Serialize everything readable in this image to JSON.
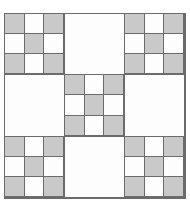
{
  "figure": {
    "canvas_width": 190,
    "canvas_height": 206,
    "background_color": "#ffffff"
  },
  "style": {
    "shaded_color": "#c9c9c9",
    "blank_color": "#fdfdfd",
    "line_color": "#6b6b6b",
    "outer_border_color": "#6b6b6b",
    "line_width": 1
  },
  "grid": {
    "rows": 3,
    "columns": 3,
    "cell_kind_legend": {
      "pieced": "3x3 checkerboard block",
      "plain": "solid blank block"
    },
    "cells": [
      {
        "index": 0,
        "row": 0,
        "column": 0,
        "position": "top-left",
        "kind": "pieced"
      },
      {
        "index": 1,
        "row": 0,
        "column": 1,
        "position": "top-center",
        "kind": "plain"
      },
      {
        "index": 2,
        "row": 0,
        "column": 2,
        "position": "top-right",
        "kind": "pieced"
      },
      {
        "index": 3,
        "row": 1,
        "column": 0,
        "position": "middle-left",
        "kind": "plain"
      },
      {
        "index": 4,
        "row": 1,
        "column": 1,
        "position": "center",
        "kind": "pieced"
      },
      {
        "index": 5,
        "row": 1,
        "column": 2,
        "position": "middle-right",
        "kind": "plain"
      },
      {
        "index": 6,
        "row": 2,
        "column": 0,
        "position": "bottom-left",
        "kind": "pieced"
      },
      {
        "index": 7,
        "row": 2,
        "column": 1,
        "position": "bottom-center",
        "kind": "plain"
      },
      {
        "index": 8,
        "row": 2,
        "column": 2,
        "position": "bottom-right",
        "kind": "pieced"
      }
    ]
  },
  "block_pattern": {
    "rows": 3,
    "columns": 3,
    "patches": [
      "shaded",
      "blank",
      "shaded",
      "blank",
      "shaded",
      "blank",
      "shaded",
      "blank",
      "shaded"
    ],
    "shaded_count": 5,
    "blank_count": 4
  },
  "counts": {
    "pieced_blocks": 5,
    "plain_blocks": 4,
    "total_blocks": 9,
    "total_shaded_patches": 25,
    "total_blank_patches": 20
  }
}
